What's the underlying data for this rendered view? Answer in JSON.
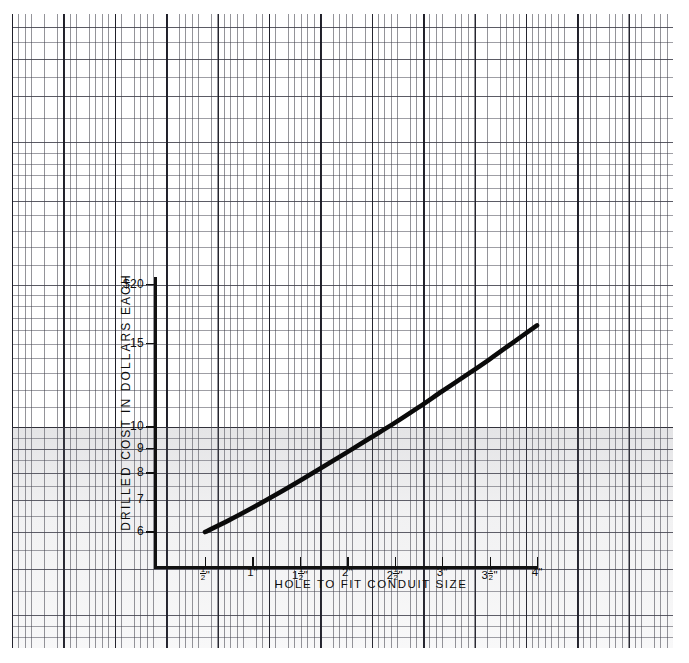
{
  "page": {
    "background_color": "#ffffff",
    "paper_type": "semi-logarithmic graph paper",
    "grid_color_fine": "#3c3c46",
    "grid_color_major": "#191923",
    "ink_color": "#0d0d0d"
  },
  "chart_data": {
    "type": "line",
    "title": "",
    "subtitle": "",
    "xlabel": "HOLE TO FIT CONDUIT SIZE",
    "ylabel": "DRILLED COST IN DOLLARS EACH",
    "yscale": "log",
    "xscale": "linear",
    "grid": true,
    "legend": "none",
    "xtick_labels": [
      "½\"",
      "1\"",
      "1½\"",
      "2\"",
      "2½\"",
      "3\"",
      "3½\"",
      "4\""
    ],
    "xtick_values": [
      0.5,
      1.0,
      1.5,
      2.0,
      2.5,
      3.0,
      3.5,
      4.0
    ],
    "ytick_labels": [
      "$20",
      "15",
      "10",
      "9",
      "8",
      "7",
      "6"
    ],
    "ytick_values": [
      20,
      15,
      10,
      9,
      8,
      7,
      6
    ],
    "ylim": [
      5.6,
      21
    ],
    "xlim": [
      0.25,
      4.3
    ],
    "series": [
      {
        "name": "Drilled cost",
        "x": [
          0.5,
          0.75,
          1.0,
          1.25,
          1.5,
          1.75,
          2.0,
          2.25,
          2.5,
          2.75,
          3.0,
          3.25,
          3.5,
          3.75,
          4.0
        ],
        "values": [
          6.0,
          6.35,
          6.75,
          7.2,
          7.7,
          8.25,
          8.85,
          9.5,
          10.2,
          11.0,
          11.9,
          12.85,
          13.9,
          15.1,
          16.4
        ]
      }
    ]
  },
  "axis": {
    "y_title": "DRILLED COST IN DOLLARS EACH",
    "x_title": "HOLE TO FIT CONDUIT SIZE",
    "y_ticks": [
      {
        "label": "$20",
        "value": 20
      },
      {
        "label": "15",
        "value": 15
      },
      {
        "label": "10",
        "value": 10
      },
      {
        "label": "9",
        "value": 9
      },
      {
        "label": "8",
        "value": 8
      },
      {
        "label": "7",
        "value": 7
      },
      {
        "label": "6",
        "value": 6
      }
    ],
    "x_ticks": [
      {
        "whole": "",
        "num": "1",
        "den": "2",
        "unit": "\"",
        "value": 0.5
      },
      {
        "whole": "1",
        "num": "",
        "den": "",
        "unit": "\"",
        "value": 1.0
      },
      {
        "whole": "1",
        "num": "1",
        "den": "2",
        "unit": "\"",
        "value": 1.5
      },
      {
        "whole": "2",
        "num": "",
        "den": "",
        "unit": "\"",
        "value": 2.0
      },
      {
        "whole": "2",
        "num": "1",
        "den": "2",
        "unit": "\"",
        "value": 2.5
      },
      {
        "whole": "3",
        "num": "",
        "den": "",
        "unit": "\"",
        "value": 3.0
      },
      {
        "whole": "3",
        "num": "1",
        "den": "2",
        "unit": "\"",
        "value": 3.5
      },
      {
        "whole": "4",
        "num": "",
        "den": "",
        "unit": "\"",
        "value": 4.0
      }
    ]
  }
}
